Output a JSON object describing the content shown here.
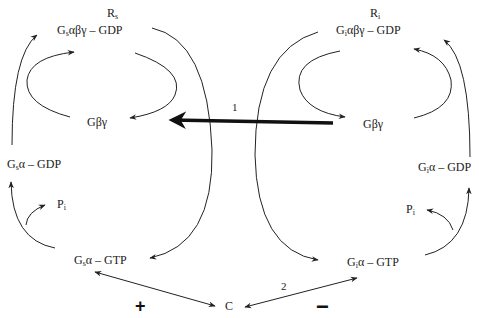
{
  "diagram": {
    "left_cycle": {
      "receptor": {
        "base": "R",
        "sub": "s"
      },
      "heterotrimer": {
        "base": "G",
        "sub": "s",
        "rest": "αβγ – GDP"
      },
      "beta_gamma": "Gβγ",
      "alpha_gdp": {
        "base": "G",
        "sub": "s",
        "rest": "α – GDP"
      },
      "phosphate": {
        "base": "P",
        "sub": "i"
      },
      "alpha_gtp": {
        "base": "G",
        "sub": "s",
        "rest": "α – GTP"
      },
      "effect_sign": "+"
    },
    "right_cycle": {
      "receptor": {
        "base": "R",
        "sub": "i"
      },
      "heterotrimer": {
        "base": "G",
        "sub": "i",
        "rest": "αβγ – GDP"
      },
      "beta_gamma": "Gβγ",
      "alpha_gdp": {
        "base": "G",
        "sub": "i",
        "rest": "α – GDP"
      },
      "phosphate": {
        "base": "P",
        "sub": "i"
      },
      "alpha_gtp": {
        "base": "G",
        "sub": "i",
        "rest": "α – GTP"
      },
      "effect_sign": "−"
    },
    "effector": "C",
    "arrow_labels": {
      "bold_arrow": "1",
      "inhibit_arrow": "2"
    },
    "colors": {
      "line": "#222222",
      "text": "#222222"
    }
  }
}
